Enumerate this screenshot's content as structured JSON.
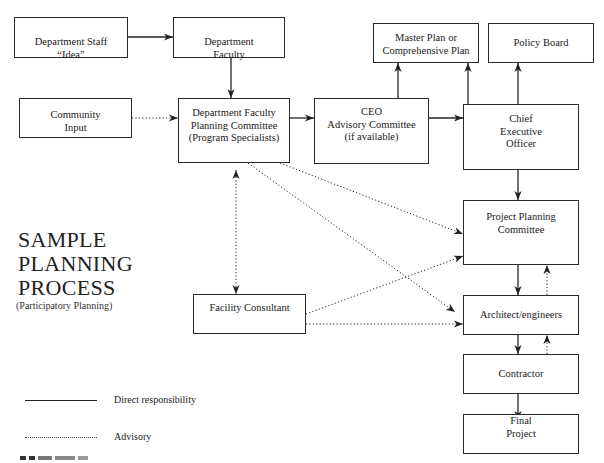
{
  "title": {
    "lines": [
      "SAMPLE",
      "PLANNING",
      "PROCESS"
    ],
    "subtitle": "(Participatory Planning)"
  },
  "nodes": [
    {
      "id": "dept-staff",
      "lines": [
        "Department Staff",
        "“Idea”"
      ],
      "x": 14,
      "y": 17,
      "w": 114,
      "h": 41,
      "pad": 18
    },
    {
      "id": "dept-faculty",
      "lines": [
        "Department",
        "Faculty"
      ],
      "x": 173,
      "y": 17,
      "w": 112,
      "h": 41,
      "pad": 18
    },
    {
      "id": "community-input",
      "lines": [
        "Community",
        "Input"
      ],
      "x": 19,
      "y": 98,
      "w": 113,
      "h": 40,
      "pad": 10
    },
    {
      "id": "dfpc",
      "lines": [
        "Department Faculty",
        "Planning Committee",
        "(Program Specialists)"
      ],
      "x": 178,
      "y": 98,
      "w": 112,
      "h": 65,
      "pad": 8
    },
    {
      "id": "ceo-advisory",
      "lines": [
        "CEO",
        "Advisory Committee",
        "(if available)"
      ],
      "x": 314,
      "y": 98,
      "w": 115,
      "h": 66,
      "pad": 7
    },
    {
      "id": "master-plan",
      "lines": [
        "Master Plan or",
        "Comprehensive Plan"
      ],
      "x": 373,
      "y": 23,
      "w": 106,
      "h": 40,
      "pad": 8
    },
    {
      "id": "policy-board",
      "lines": [
        "Policy Board"
      ],
      "x": 488,
      "y": 23,
      "w": 106,
      "h": 40,
      "pad": 13
    },
    {
      "id": "ceo",
      "lines": [
        "Chief",
        "Executive",
        "Officer"
      ],
      "x": 463,
      "y": 104,
      "w": 116,
      "h": 66,
      "pad": 8
    },
    {
      "id": "project-planning",
      "lines": [
        "Project Planning",
        "Committee"
      ],
      "x": 463,
      "y": 200,
      "w": 116,
      "h": 65,
      "pad": 10
    },
    {
      "id": "architect",
      "lines": [
        "Architect/engineers"
      ],
      "x": 463,
      "y": 295,
      "w": 116,
      "h": 40,
      "pad": 13
    },
    {
      "id": "contractor",
      "lines": [
        "Contractor"
      ],
      "x": 463,
      "y": 354,
      "w": 116,
      "h": 40,
      "pad": 13
    },
    {
      "id": "final-project",
      "lines": [
        "Final",
        "Project"
      ],
      "x": 463,
      "y": 414,
      "w": 116,
      "h": 40,
      "pad": 0
    },
    {
      "id": "facility-consultant",
      "lines": [
        "Facility Consultant"
      ],
      "x": 193,
      "y": 294,
      "w": 113,
      "h": 40,
      "pad": 7
    }
  ],
  "edges": [
    {
      "from": "dept-staff",
      "to": "dept-faculty",
      "style": "direct",
      "pts": [
        [
          128,
          37
        ],
        [
          173,
          37
        ]
      ],
      "heads": "end"
    },
    {
      "from": "dept-faculty",
      "to": "dfpc",
      "style": "direct",
      "pts": [
        [
          231,
          58
        ],
        [
          231,
          98
        ]
      ],
      "heads": "end"
    },
    {
      "from": "community-input",
      "to": "dfpc",
      "style": "advisory",
      "pts": [
        [
          132,
          118
        ],
        [
          178,
          118
        ]
      ],
      "heads": "end"
    },
    {
      "from": "dfpc",
      "to": "ceo-advisory",
      "style": "direct",
      "pts": [
        [
          290,
          118
        ],
        [
          314,
          118
        ]
      ],
      "heads": "end"
    },
    {
      "from": "ceo-advisory",
      "to": "master-plan",
      "style": "direct",
      "pts": [
        [
          398,
          98
        ],
        [
          398,
          63
        ]
      ],
      "heads": "end"
    },
    {
      "from": "ceo-advisory",
      "to": "ceo",
      "style": "direct",
      "pts": [
        [
          429,
          118
        ],
        [
          463,
          118
        ]
      ],
      "heads": "end"
    },
    {
      "from": "ceo",
      "to": "master-plan",
      "style": "direct",
      "pts": [
        [
          468,
          104
        ],
        [
          468,
          63
        ]
      ],
      "heads": "end"
    },
    {
      "from": "ceo",
      "to": "policy-board",
      "style": "direct",
      "pts": [
        [
          518,
          104
        ],
        [
          518,
          63
        ]
      ],
      "heads": "end"
    },
    {
      "from": "ceo",
      "to": "project-planning",
      "style": "direct",
      "pts": [
        [
          518,
          170
        ],
        [
          518,
          200
        ]
      ],
      "heads": "end"
    },
    {
      "from": "dfpc",
      "to": "project-planning",
      "style": "advisory",
      "pts": [
        [
          280,
          163
        ],
        [
          463,
          234
        ]
      ],
      "heads": "end"
    },
    {
      "from": "dfpc",
      "to": "architect",
      "style": "advisory",
      "pts": [
        [
          248,
          163
        ],
        [
          455,
          312
        ]
      ],
      "heads": "end"
    },
    {
      "from": "dfpc",
      "to": "facility-consultant",
      "style": "advisory",
      "pts": [
        [
          236,
          170
        ],
        [
          236,
          294
        ]
      ],
      "heads": "both"
    },
    {
      "from": "facility-consultant",
      "to": "project-planning",
      "style": "advisory",
      "pts": [
        [
          306,
          314
        ],
        [
          463,
          256
        ]
      ],
      "heads": "end"
    },
    {
      "from": "facility-consultant",
      "to": "architect",
      "style": "advisory",
      "pts": [
        [
          306,
          324
        ],
        [
          463,
          324
        ]
      ],
      "heads": "end"
    },
    {
      "from": "project-planning",
      "to": "architect",
      "style": "direct",
      "pts": [
        [
          518,
          265
        ],
        [
          518,
          295
        ]
      ],
      "heads": "end"
    },
    {
      "from": "architect",
      "to": "project-planning",
      "style": "advisory",
      "pts": [
        [
          547,
          295
        ],
        [
          547,
          265
        ]
      ],
      "heads": "end"
    },
    {
      "from": "architect",
      "to": "contractor",
      "style": "direct",
      "pts": [
        [
          518,
          335
        ],
        [
          518,
          354
        ]
      ],
      "heads": "end"
    },
    {
      "from": "contractor",
      "to": "architect",
      "style": "advisory",
      "pts": [
        [
          547,
          354
        ],
        [
          547,
          335
        ]
      ],
      "heads": "end"
    },
    {
      "from": "contractor",
      "to": "final-project",
      "style": "direct",
      "pts": [
        [
          518,
          394
        ],
        [
          518,
          420
        ]
      ],
      "heads": "end"
    }
  ],
  "legend": {
    "direct_label": "Direct responsibility",
    "advisory_label": "Advisory"
  },
  "colors": {
    "line": "#222222",
    "box_border": "#2a2a2a",
    "background": "#ffffff"
  }
}
